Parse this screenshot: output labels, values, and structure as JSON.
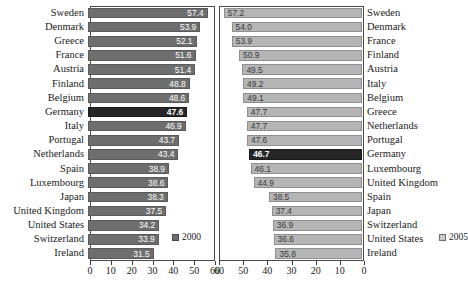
{
  "chart_data": {
    "type": "bar",
    "title": "",
    "xlabel": "",
    "ylabel": "",
    "orientation": "horizontal",
    "grid": false,
    "panels": [
      {
        "name": "left-panel",
        "series_name": "2000",
        "color": "#6e6e6e",
        "highlight_color": "#262626",
        "axis": {
          "min": 0,
          "max": 60,
          "ticks": [
            0,
            10,
            20,
            30,
            40,
            50,
            60
          ],
          "direction": "left-to-right"
        },
        "categories": [
          "Sweden",
          "Denmark",
          "Greece",
          "France",
          "Austria",
          "Finland",
          "Belgium",
          "Germany",
          "Italy",
          "Portugal",
          "Netherlands",
          "Spain",
          "Luxembourg",
          "Japan",
          "United Kingdom",
          "United States",
          "Switzerland",
          "Ireland"
        ],
        "values": [
          57.4,
          53.9,
          52.1,
          51.6,
          51.4,
          48.8,
          48.6,
          47.6,
          46.9,
          43.7,
          43.4,
          38.9,
          38.6,
          38.3,
          37.5,
          34.2,
          33.9,
          31.5
        ],
        "highlighted": [
          "Germany"
        ]
      },
      {
        "name": "right-panel",
        "series_name": "2005",
        "color": "#b5b5b5",
        "highlight_color": "#262626",
        "axis": {
          "min": 0,
          "max": 60,
          "ticks": [
            60,
            50,
            40,
            30,
            20,
            10,
            0
          ],
          "direction": "right-to-left"
        },
        "categories": [
          "Sweden",
          "Denmark",
          "France",
          "Finland",
          "Austria",
          "Italy",
          "Belgium",
          "Greece",
          "Netherlands",
          "Portugal",
          "Germany",
          "Luxembourg",
          "United Kingdom",
          "Spain",
          "Japan",
          "Switzerland",
          "United States",
          "Ireland"
        ],
        "values": [
          57.2,
          54.0,
          53.9,
          50.9,
          49.5,
          49.2,
          49.1,
          47.7,
          47.7,
          47.6,
          46.7,
          46.1,
          44.9,
          38.5,
          37.4,
          36.9,
          36.6,
          35.8
        ],
        "highlighted": [
          "Germany"
        ]
      }
    ],
    "legend": [
      {
        "label": "2000",
        "color": "#6e6e6e"
      },
      {
        "label": "2005",
        "color": "#c9c9c9"
      }
    ],
    "legend_position": "bottom-center"
  }
}
